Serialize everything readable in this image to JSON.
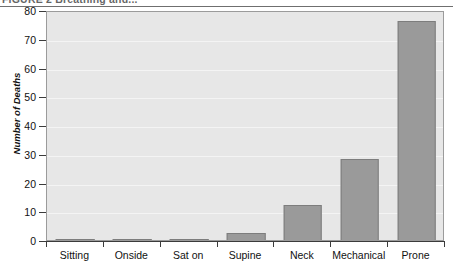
{
  "figure": {
    "caption": "FIGURE 2  Breathing and..."
  },
  "chart_data": {
    "type": "bar",
    "title": "",
    "xlabel": "",
    "ylabel": "Number of Deaths",
    "categories": [
      "Sitting",
      "Onside",
      "Sat on",
      "Supine",
      "Neck",
      "Mechanical",
      "Prone"
    ],
    "values": [
      1,
      1,
      1,
      3,
      13,
      29,
      77
    ],
    "ylim": [
      0,
      80
    ],
    "ytick_labels": [
      "0",
      "10",
      "20",
      "30",
      "40",
      "50",
      "60",
      "70",
      "80"
    ],
    "ytick_values": [
      0,
      10,
      20,
      30,
      40,
      50,
      60,
      70,
      80
    ],
    "grid": true,
    "legend": null,
    "colors": {
      "bar_fill": "#9a9a9a",
      "bar_stroke": "#7d7d7d",
      "plot_background": "#e7e7e7",
      "axis": "#3b3b3b"
    }
  }
}
